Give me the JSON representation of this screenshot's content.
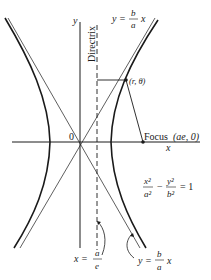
{
  "diagram": {
    "labels": {
      "y_axis": "y",
      "x_axis": "x",
      "origin": "0",
      "directrix": "Directrix",
      "point": "(r, θ)",
      "focus_word": "Focus",
      "focus_coords": "(ae, 0)",
      "asymptote_top": {
        "lhs": "y =",
        "num": "b",
        "den": "a",
        "rhs": "x"
      },
      "asymptote_bottom": {
        "lhs": "y =",
        "num": "b",
        "den": "a",
        "rhs": "x"
      },
      "directrix_eq": {
        "lhs": "x =",
        "num": "a",
        "den": "e"
      },
      "equation": {
        "t1_num": "x²",
        "t1_den": "a²",
        "minus": "−",
        "t2_num": "y²",
        "t2_den": "b²",
        "rhs": "= 1"
      }
    },
    "colors": {
      "ink": "#1a1a1a",
      "background": "#ffffff"
    }
  }
}
